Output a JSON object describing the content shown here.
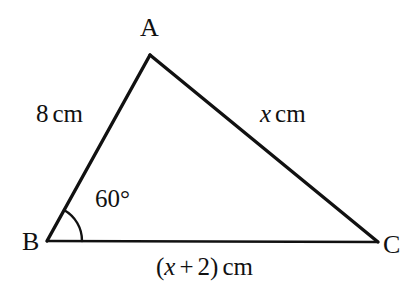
{
  "figure": {
    "type": "geometry-diagram",
    "shape": "triangle",
    "background_color": "#ffffff",
    "stroke_color": "#111111",
    "vertices": [
      {
        "name": "A",
        "label": "A",
        "x": 150,
        "y": 55
      },
      {
        "name": "B",
        "label": "B",
        "x": 47,
        "y": 241
      },
      {
        "name": "C",
        "label": "C",
        "x": 378,
        "y": 242
      }
    ],
    "sides": [
      {
        "name": "AB",
        "label_number": "8",
        "label_unit": "cm",
        "label_full": "8 cm"
      },
      {
        "name": "AC",
        "label_number": "x",
        "label_unit": "cm",
        "label_full": "x cm",
        "italic_part": "x"
      },
      {
        "name": "BC",
        "label_open": "(",
        "label_expr": "x + 2",
        "label_close": ")",
        "label_unit": "cm",
        "label_full": "(x + 2) cm",
        "italic_part": "x"
      }
    ],
    "angles": [
      {
        "at_vertex": "B",
        "value": "60",
        "unit": "°",
        "label_full": "60°",
        "arc_radius": 35
      }
    ]
  },
  "labels": {
    "vertex_a": "A",
    "vertex_b": "B",
    "vertex_c": "C",
    "side_ab_value": "8",
    "side_ab_unit": "cm",
    "side_ac_value": "x",
    "side_ac_unit": "cm",
    "side_bc_paren_open": "(",
    "side_bc_var": "x",
    "side_bc_operator": "+",
    "side_bc_const": "2",
    "side_bc_paren_close": ")",
    "side_bc_unit": "cm",
    "angle_b": "60°"
  }
}
